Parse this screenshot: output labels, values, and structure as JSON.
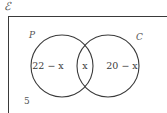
{
  "figure": {
    "type": "venn-diagram",
    "universal_set_symbol": "ℰ",
    "outside_count": "5",
    "stroke_color": "#3a3a3a",
    "background_color": "#ffffff",
    "text_color": "#3a3a3a"
  },
  "sets": [
    {
      "label": "P",
      "region_value": "22 − x"
    },
    {
      "label": "C",
      "region_value": "20 − x"
    }
  ],
  "regions": [
    {
      "name": "P only",
      "value": "22 − x"
    },
    {
      "name": "P and C",
      "value": "x"
    },
    {
      "name": "C only",
      "value": "20 − x"
    },
    {
      "name": "outside both",
      "value": "5"
    }
  ],
  "geometry": {
    "rect": {
      "x": 8,
      "y": 16,
      "width": 159,
      "height": 97
    },
    "circle_left": {
      "cx": 62,
      "cy": 66,
      "r": 31
    },
    "circle_right": {
      "cx": 108,
      "cy": 66,
      "r": 31
    }
  }
}
